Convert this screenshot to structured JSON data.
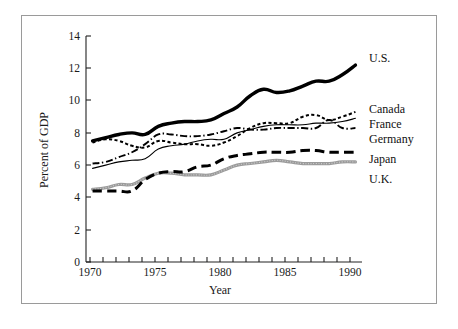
{
  "figure": {
    "frame_color": "#9a9a9a",
    "background": "#ffffff"
  },
  "axes": {
    "x_title": "Year",
    "y_title": "Percent of GDP",
    "x_ticks": [
      "1970",
      "1975",
      "1980",
      "1985",
      "1990"
    ],
    "y_ticks": [
      "0",
      "2",
      "4",
      "6",
      "8",
      "10",
      "12",
      "14"
    ]
  },
  "legend": {
    "items": [
      {
        "label": "U.S.",
        "style": "thick-solid",
        "color": "#000000"
      },
      {
        "label": "Canada",
        "style": "dotted",
        "color": "#000000"
      },
      {
        "label": "France",
        "style": "thin-solid",
        "color": "#000000"
      },
      {
        "label": "Germany",
        "style": "dash-dot",
        "color": "#000000"
      },
      {
        "label": "Japan",
        "style": "thick-dashed",
        "color": "#000000"
      },
      {
        "label": "U.K.",
        "style": "gray-textured",
        "color": "#9b9b9b"
      }
    ]
  },
  "chart_data": {
    "type": "line",
    "title": "",
    "xlabel": "Year",
    "ylabel": "Percent of GDP",
    "xlim": [
      1969.5,
      1990.5
    ],
    "ylim": [
      0,
      14
    ],
    "xticks": [
      1970,
      1975,
      1980,
      1985,
      1990
    ],
    "yticks": [
      0,
      2,
      4,
      6,
      8,
      10,
      12,
      14
    ],
    "grid": false,
    "legend_position": "right-outside",
    "x": [
      1970,
      1971,
      1972,
      1973,
      1974,
      1975,
      1976,
      1977,
      1978,
      1979,
      1980,
      1981,
      1982,
      1983,
      1984,
      1985,
      1986,
      1987,
      1988,
      1989,
      1990
    ],
    "series": [
      {
        "name": "U.S.",
        "style": "thick-solid",
        "values": [
          7.5,
          7.7,
          7.9,
          8.0,
          7.9,
          8.4,
          8.6,
          8.7,
          8.7,
          8.8,
          9.2,
          9.6,
          10.3,
          10.7,
          10.5,
          10.6,
          10.9,
          11.2,
          11.2,
          11.6,
          12.2
        ]
      },
      {
        "name": "Canada",
        "style": "dotted",
        "values": [
          7.4,
          7.6,
          7.5,
          7.2,
          7.1,
          7.5,
          7.4,
          7.3,
          7.3,
          7.2,
          7.4,
          7.8,
          8.3,
          8.6,
          8.6,
          8.6,
          9.0,
          9.1,
          8.8,
          9.0,
          9.3
        ]
      },
      {
        "name": "France",
        "style": "thin-solid",
        "values": [
          5.8,
          6.0,
          6.2,
          6.3,
          6.4,
          7.0,
          7.2,
          7.3,
          7.5,
          7.6,
          7.6,
          8.0,
          8.2,
          8.4,
          8.5,
          8.5,
          8.5,
          8.6,
          8.6,
          8.7,
          8.9
        ]
      },
      {
        "name": "Germany",
        "style": "dash-dot",
        "values": [
          6.1,
          6.2,
          6.5,
          6.8,
          7.3,
          7.9,
          7.9,
          7.8,
          7.8,
          7.9,
          8.1,
          8.3,
          8.2,
          8.2,
          8.3,
          8.3,
          8.3,
          8.3,
          8.8,
          8.3,
          8.3
        ]
      },
      {
        "name": "Japan",
        "style": "thick-dashed",
        "values": [
          4.4,
          4.4,
          4.4,
          4.4,
          5.1,
          5.5,
          5.6,
          5.6,
          5.9,
          6.0,
          6.4,
          6.6,
          6.7,
          6.8,
          6.8,
          6.8,
          6.9,
          6.9,
          6.8,
          6.8,
          6.8
        ]
      },
      {
        "name": "U.K.",
        "style": "gray-textured",
        "values": [
          4.5,
          4.6,
          4.8,
          4.8,
          5.2,
          5.5,
          5.5,
          5.4,
          5.4,
          5.4,
          5.7,
          6.0,
          6.1,
          6.2,
          6.3,
          6.2,
          6.1,
          6.1,
          6.1,
          6.2,
          6.2
        ]
      }
    ]
  }
}
